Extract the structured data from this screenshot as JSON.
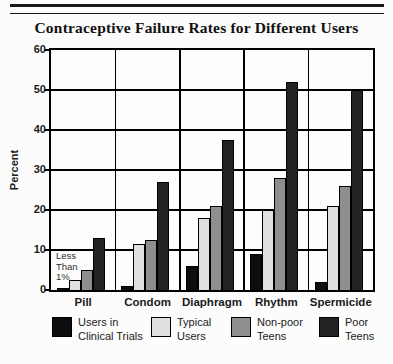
{
  "figure": {
    "background": "#fcfcfc",
    "rule_color": "#1a1a1a"
  },
  "chart_data": {
    "type": "bar",
    "title": "Contraceptive Failure Rates for Different Users",
    "ylabel": "Percent",
    "ylim": [
      0,
      60
    ],
    "yticks": [
      0,
      10,
      20,
      30,
      40,
      50,
      60
    ],
    "grid": true,
    "legend_position": "bottom",
    "categories": [
      "Pill",
      "Condom",
      "Diaphragm",
      "Rhythm",
      "Spermicide"
    ],
    "series": [
      {
        "name": "Users in Clinical Trials",
        "color": "#0d0d0d",
        "values": [
          0.5,
          1,
          6,
          9,
          2
        ]
      },
      {
        "name": "Typical Users",
        "color": "#e0e0e0",
        "values": [
          2.5,
          11.5,
          18,
          20,
          21
        ]
      },
      {
        "name": "Non-poor Teens",
        "color": "#8e8e8e",
        "values": [
          5,
          12.5,
          21,
          28,
          26
        ]
      },
      {
        "name": "Poor Teens",
        "color": "#232323",
        "values": [
          13,
          27,
          37.5,
          52,
          50
        ]
      }
    ],
    "legend": [
      {
        "lines": [
          "Users in",
          "Clinical Trials"
        ]
      },
      {
        "lines": [
          "Typical",
          "Users"
        ]
      },
      {
        "lines": [
          "Non-poor",
          "Teens"
        ]
      },
      {
        "lines": [
          "Poor",
          "Teens"
        ]
      }
    ],
    "annotation": {
      "lines": [
        "Less",
        "Than",
        "1%"
      ]
    }
  }
}
